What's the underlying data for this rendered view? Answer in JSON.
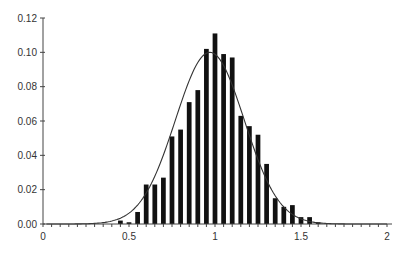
{
  "chart_data": {
    "type": "bar",
    "title": "",
    "xlabel": "",
    "ylabel": "",
    "xlim": [
      0,
      2
    ],
    "ylim": [
      0,
      0.12
    ],
    "grid": false,
    "legend": null,
    "x_ticks": [
      "0",
      "0.5",
      "1",
      "1.5",
      "2"
    ],
    "x_tick_values": [
      0,
      0.5,
      1,
      1.5,
      2
    ],
    "x_minor_tick_step": 0.05,
    "y_ticks": [
      "0.00",
      "0.02",
      "0.04",
      "0.06",
      "0.08",
      "0.10",
      "0.12"
    ],
    "y_tick_values": [
      0,
      0.02,
      0.04,
      0.06,
      0.08,
      0.1,
      0.12
    ],
    "bin_width": 0.05,
    "series": [
      {
        "name": "histogram",
        "type": "bar",
        "x": [
          0.45,
          0.5,
          0.55,
          0.6,
          0.65,
          0.7,
          0.75,
          0.8,
          0.85,
          0.9,
          0.95,
          1.0,
          1.05,
          1.1,
          1.15,
          1.2,
          1.25,
          1.3,
          1.35,
          1.4,
          1.45,
          1.5,
          1.55,
          1.6
        ],
        "values": [
          0.002,
          0.001,
          0.007,
          0.023,
          0.023,
          0.027,
          0.051,
          0.055,
          0.071,
          0.078,
          0.102,
          0.111,
          0.099,
          0.097,
          0.063,
          0.057,
          0.052,
          0.035,
          0.015,
          0.01,
          0.011,
          0.004,
          0.004,
          0.001
        ]
      },
      {
        "name": "normal fit",
        "type": "line",
        "mean": 0.97,
        "sd": 0.2,
        "peak": 0.1
      }
    ],
    "colors": {
      "bars": "#111111",
      "curve": "#333333",
      "axis": "#444444"
    }
  }
}
